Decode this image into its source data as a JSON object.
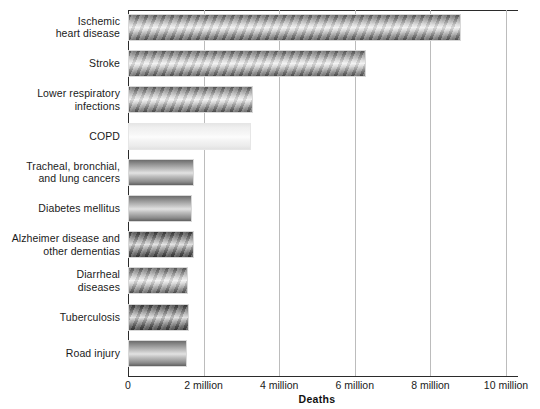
{
  "chart_data": {
    "type": "bar",
    "orientation": "horizontal",
    "title": "",
    "xlabel": "Deaths",
    "ylabel": "",
    "xlim": [
      0,
      10000000
    ],
    "grid": true,
    "legend": null,
    "tick_labels": [
      "0",
      "2 million",
      "4 million",
      "6 million",
      "8 million",
      "10 million"
    ],
    "tick_values": [
      0,
      2000000,
      4000000,
      6000000,
      8000000,
      10000000
    ],
    "categories": [
      "Ischemic heart disease",
      "Stroke",
      "Lower respiratory infections",
      "COPD",
      "Tracheal, bronchial, and lung cancers",
      "Diabetes mellitus",
      "Alzheimer disease and other dementias",
      "Diarrheal diseases",
      "Tuberculosis",
      "Road injury"
    ],
    "category_lines": [
      [
        "Ischemic",
        "heart disease"
      ],
      [
        "Stroke"
      ],
      [
        "Lower respiratory",
        "infections"
      ],
      [
        "COPD"
      ],
      [
        "Tracheal, bronchial,",
        "and lung cancers"
      ],
      [
        "Diabetes mellitus"
      ],
      [
        "Alzheimer disease and",
        "other dementias"
      ],
      [
        "Diarrheal",
        "diseases"
      ],
      [
        "Tuberculosis"
      ],
      [
        "Road injury"
      ]
    ],
    "values": [
      8800000,
      6300000,
      3300000,
      3250000,
      1750000,
      1700000,
      1750000,
      1600000,
      1620000,
      1550000
    ],
    "value_labels": [
      "8.8 million",
      "6.3 million",
      "3.3 million",
      "3.2 million",
      "1.7 million",
      "1.7 million",
      "1.7 million",
      "1.6 million",
      "1.6 million",
      "1.5 million"
    ],
    "bar_styles": [
      "striped",
      "striped",
      "striped",
      "light",
      "plain",
      "plain",
      "dark",
      "striped",
      "dark",
      "plain"
    ]
  },
  "axis": {
    "x_title": "Deaths"
  }
}
